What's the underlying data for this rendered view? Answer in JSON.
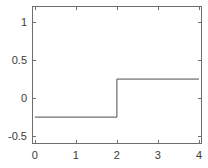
{
  "chart_data": {
    "type": "line",
    "title": "",
    "subtitle": "",
    "xlabel": "",
    "ylabel": "",
    "xlim": [
      -0.07,
      4.05
    ],
    "ylim": [
      -0.59,
      1.21
    ],
    "xticks": [
      0,
      1,
      2,
      3,
      4
    ],
    "xtick_labels": [
      "0",
      "1",
      "2",
      "3",
      "4"
    ],
    "yticks": [
      -0.5,
      0,
      0.5,
      1
    ],
    "ytick_labels": [
      "-0.5",
      "0",
      "0.5",
      "1"
    ],
    "grid": false,
    "legend": null,
    "annotations": [],
    "series": [
      {
        "name": "step",
        "drawstyle": "steps-post",
        "color": "#4d4d4d",
        "linewidth": 1,
        "x": [
          0,
          2,
          2,
          4
        ],
        "y": [
          -0.25,
          -0.25,
          0.25,
          0.25
        ]
      }
    ]
  },
  "axes": {
    "box_color": "#6e6e6e",
    "tick_color": "#6e6e6e",
    "background": "#ffffff"
  }
}
